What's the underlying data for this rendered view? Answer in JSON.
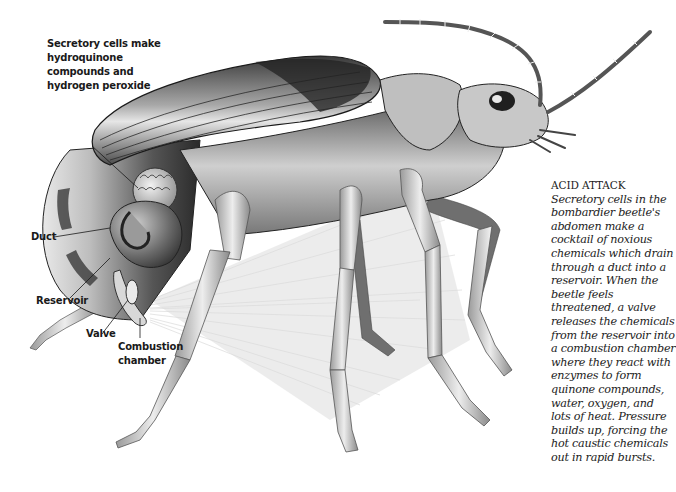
{
  "figure": {
    "labels": {
      "secretory_cells": "Secretory cells make hydroquinone compounds and hydrogen peroxide",
      "duct": "Duct",
      "reservoir": "Reservoir",
      "valve": "Valve",
      "combustion_chamber": "Combustion chamber"
    },
    "label_lines": {
      "secretory_cells": [
        "Secretory cells make",
        "hydroquinone",
        "compounds and",
        "hydrogen peroxide"
      ],
      "combustion_chamber": [
        "Combustion",
        "chamber"
      ]
    },
    "caption": {
      "lead": "ACID ATTACK",
      "body": "Secretory cells in the bombardier beetle's abdomen make a cocktail of noxious chemicals which drain through a duct into a reservoir. When the beetle feels threatened, a valve releases the chemicals from the reservoir into a combustion chamber where they react with enzymes to form quinone compounds, water, oxygen, and lots of heat. Pressure builds up, forcing the hot caustic chemicals out in rapid bursts."
    }
  },
  "colors": {
    "background": "#ffffff",
    "shell_dark": "#2a2a2a",
    "shell_mid": "#7a7a7a",
    "shell_light": "#d8d8d8",
    "spray": "#c8c8c8",
    "text": "#1a1a1a"
  }
}
